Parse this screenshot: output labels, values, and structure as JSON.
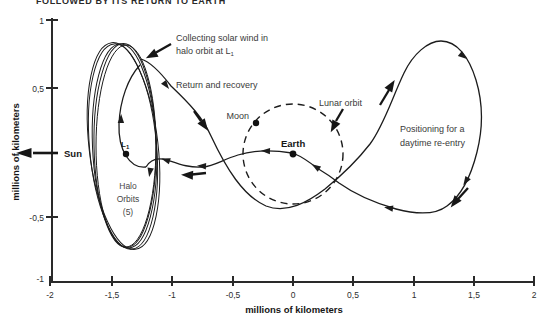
{
  "title": "FOLLOWED BY ITS RETURN TO EARTH",
  "labels": {
    "collecting_line1": "Collecting solar wind in",
    "collecting_line2_pre": "halo orbit at L",
    "collecting_line2_sub": "1",
    "return_recovery": "Return and recovery",
    "moon": "Moon",
    "lunar_orbit": "Lunar orbit",
    "earth": "Earth",
    "positioning_line1": "Positioning for a",
    "positioning_line2": "daytime re-entry",
    "sun": "Sun",
    "l1_pre": "L",
    "l1_sub": "1",
    "halo_line1": "Halo",
    "halo_line2": "Orbits",
    "halo_line3": "(5)"
  },
  "axes": {
    "x_title": "millions of kilometers",
    "y_title": "millions of kilometers",
    "x_ticks": [
      "-2",
      "-1,5",
      "-1",
      "-0,5",
      "0",
      "0,5",
      "1",
      "1,5",
      "2"
    ],
    "y_ticks": [
      "1",
      "0,5",
      "-0,5",
      "-1"
    ]
  },
  "colors": {
    "ink": "#1c1c1c",
    "axis": "#2a2a2a",
    "background": "#ffffff"
  }
}
